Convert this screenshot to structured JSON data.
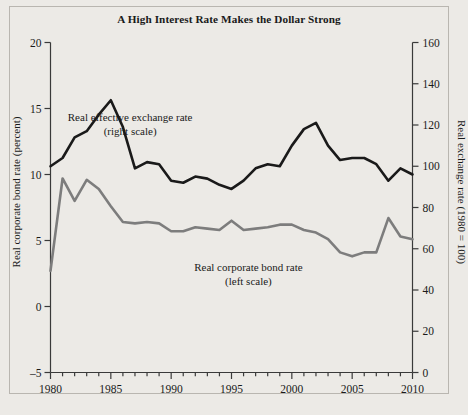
{
  "chart_data": {
    "type": "line",
    "title": "A High Interest Rate Makes the Dollar Strong",
    "xlabel": "",
    "ylabel": "Real corporate bond rate (percent)",
    "ylabel_right": "Real exchange rate (1980 = 100)",
    "xlim": [
      1980,
      2010
    ],
    "ylim": [
      -5,
      20
    ],
    "ylim_right": [
      0,
      160
    ],
    "xticks": [
      1980,
      1985,
      1990,
      1995,
      2000,
      2005,
      2010
    ],
    "xtick_labels": [
      "1980",
      "1985",
      "1990",
      "1995",
      "2000",
      "2005",
      "2010"
    ],
    "xminor_step": 1,
    "yticks": [
      -5,
      0,
      5,
      10,
      15,
      20
    ],
    "ytick_labels": [
      "-5",
      "0",
      "5",
      "10",
      "15",
      "20"
    ],
    "yticks_right": [
      0,
      20,
      40,
      60,
      80,
      100,
      120,
      140,
      160
    ],
    "ytick_labels_right": [
      "0",
      "20",
      "40",
      "60",
      "80",
      "100",
      "120",
      "140",
      "160"
    ],
    "grid": false,
    "legend_position": "inline-annotations",
    "annotations": [
      {
        "name": "exchange-rate-annotation",
        "line1": "Real effective exchange rate",
        "line2": "(right scale)",
        "x": 1986.6,
        "y_right": 122
      },
      {
        "name": "bond-rate-annotation",
        "line1": "Real corporate bond rate",
        "line2": "(left scale)",
        "x": 1996.4,
        "y_left": 2.7
      }
    ],
    "series": [
      {
        "name": "Real effective exchange rate",
        "scale": "right",
        "color": "#1a1a1a",
        "width": 2.6,
        "x": [
          1980,
          1981,
          1982,
          1983,
          1984,
          1985,
          1986,
          1987,
          1988,
          1989,
          1990,
          1991,
          1992,
          1993,
          1994,
          1995,
          1996,
          1997,
          1998,
          1999,
          2000,
          2001,
          2002,
          2003,
          2004,
          2005,
          2006,
          2007,
          2008,
          2009,
          2010
        ],
        "values": [
          100,
          104,
          114,
          117,
          125,
          132,
          119,
          99,
          102,
          101,
          93,
          92,
          95,
          94,
          91,
          89,
          93,
          99,
          101,
          100,
          110,
          118,
          121,
          110,
          103,
          104,
          104,
          101,
          93,
          99,
          96
        ]
      },
      {
        "name": "Real corporate bond rate",
        "scale": "left",
        "color": "#7d7d7d",
        "width": 2.6,
        "x": [
          1980,
          1981,
          1982,
          1983,
          1984,
          1985,
          1986,
          1987,
          1988,
          1989,
          1990,
          1991,
          1992,
          1993,
          1994,
          1995,
          1996,
          1997,
          1998,
          1999,
          2000,
          2001,
          2002,
          2003,
          2004,
          2005,
          2006,
          2007,
          2008,
          2009,
          2010
        ],
        "values": [
          2.7,
          9.7,
          8.0,
          9.6,
          8.9,
          7.6,
          6.4,
          6.3,
          6.4,
          6.3,
          5.7,
          5.7,
          6.0,
          5.9,
          5.8,
          6.5,
          5.8,
          5.9,
          6.0,
          6.2,
          6.2,
          5.8,
          5.6,
          5.1,
          4.1,
          3.8,
          4.1,
          4.1,
          6.7,
          5.3,
          5.1
        ]
      }
    ]
  }
}
